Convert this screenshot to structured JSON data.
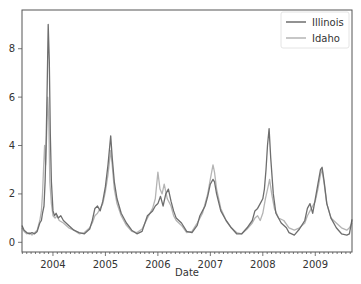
{
  "chart_data": {
    "type": "line",
    "title": "",
    "xlabel": "Date",
    "ylabel": "",
    "xlim": [
      2003.41,
      2009.7
    ],
    "ylim": [
      -0.4,
      9.6
    ],
    "grid": false,
    "legend_position": "upper right",
    "x_ticks": [
      2004,
      2005,
      2006,
      2007,
      2008,
      2009
    ],
    "x_tick_labels": [
      "2004",
      "2005",
      "2006",
      "2007",
      "2008",
      "2009"
    ],
    "y_ticks": [
      0,
      2,
      4,
      6,
      8
    ],
    "y_tick_labels": [
      "0",
      "2",
      "4",
      "6",
      "8"
    ],
    "series": [
      {
        "name": "Illinois",
        "color": "#6e6e6e",
        "points": [
          [
            2003.41,
            0.7
          ],
          [
            2003.45,
            0.5
          ],
          [
            2003.5,
            0.4
          ],
          [
            2003.55,
            0.35
          ],
          [
            2003.6,
            0.4
          ],
          [
            2003.65,
            0.35
          ],
          [
            2003.7,
            0.45
          ],
          [
            2003.75,
            0.8
          ],
          [
            2003.78,
            0.9
          ],
          [
            2003.8,
            1.2
          ],
          [
            2003.83,
            1.5
          ],
          [
            2003.85,
            2.5
          ],
          [
            2003.87,
            4.0
          ],
          [
            2003.89,
            6.5
          ],
          [
            2003.91,
            9.0
          ],
          [
            2003.93,
            7.5
          ],
          [
            2003.95,
            4.5
          ],
          [
            2003.97,
            2.5
          ],
          [
            2004.0,
            1.3
          ],
          [
            2004.03,
            1.1
          ],
          [
            2004.06,
            1.2
          ],
          [
            2004.1,
            1.0
          ],
          [
            2004.15,
            1.1
          ],
          [
            2004.2,
            0.9
          ],
          [
            2004.3,
            0.7
          ],
          [
            2004.4,
            0.5
          ],
          [
            2004.5,
            0.4
          ],
          [
            2004.6,
            0.35
          ],
          [
            2004.7,
            0.55
          ],
          [
            2004.75,
            0.9
          ],
          [
            2004.8,
            1.4
          ],
          [
            2004.85,
            1.5
          ],
          [
            2004.9,
            1.3
          ],
          [
            2004.95,
            1.7
          ],
          [
            2005.0,
            2.3
          ],
          [
            2005.05,
            3.2
          ],
          [
            2005.1,
            4.4
          ],
          [
            2005.13,
            3.5
          ],
          [
            2005.17,
            2.5
          ],
          [
            2005.22,
            1.8
          ],
          [
            2005.3,
            1.2
          ],
          [
            2005.4,
            0.8
          ],
          [
            2005.5,
            0.5
          ],
          [
            2005.6,
            0.35
          ],
          [
            2005.7,
            0.45
          ],
          [
            2005.8,
            1.1
          ],
          [
            2005.9,
            1.3
          ],
          [
            2005.95,
            1.5
          ],
          [
            2006.0,
            1.6
          ],
          [
            2006.05,
            1.9
          ],
          [
            2006.1,
            1.5
          ],
          [
            2006.15,
            2.0
          ],
          [
            2006.2,
            2.2
          ],
          [
            2006.25,
            1.7
          ],
          [
            2006.3,
            1.3
          ],
          [
            2006.35,
            1.0
          ],
          [
            2006.45,
            0.8
          ],
          [
            2006.55,
            0.45
          ],
          [
            2006.65,
            0.4
          ],
          [
            2006.75,
            0.7
          ],
          [
            2006.8,
            1.1
          ],
          [
            2006.85,
            1.3
          ],
          [
            2006.9,
            1.5
          ],
          [
            2006.95,
            1.9
          ],
          [
            2007.0,
            2.4
          ],
          [
            2007.05,
            2.6
          ],
          [
            2007.08,
            2.5
          ],
          [
            2007.12,
            2.0
          ],
          [
            2007.2,
            1.3
          ],
          [
            2007.3,
            0.9
          ],
          [
            2007.4,
            0.6
          ],
          [
            2007.5,
            0.35
          ],
          [
            2007.6,
            0.35
          ],
          [
            2007.7,
            0.6
          ],
          [
            2007.8,
            0.9
          ],
          [
            2007.85,
            1.3
          ],
          [
            2007.9,
            1.4
          ],
          [
            2007.95,
            1.6
          ],
          [
            2008.0,
            1.8
          ],
          [
            2008.03,
            2.2
          ],
          [
            2008.06,
            3.0
          ],
          [
            2008.09,
            4.0
          ],
          [
            2008.12,
            4.7
          ],
          [
            2008.15,
            3.5
          ],
          [
            2008.2,
            2.0
          ],
          [
            2008.25,
            1.2
          ],
          [
            2008.35,
            0.8
          ],
          [
            2008.45,
            0.6
          ],
          [
            2008.5,
            0.4
          ],
          [
            2008.6,
            0.3
          ],
          [
            2008.7,
            0.55
          ],
          [
            2008.8,
            0.9
          ],
          [
            2008.85,
            1.4
          ],
          [
            2008.9,
            1.6
          ],
          [
            2008.95,
            1.2
          ],
          [
            2009.0,
            1.8
          ],
          [
            2009.05,
            2.4
          ],
          [
            2009.1,
            3.0
          ],
          [
            2009.13,
            3.1
          ],
          [
            2009.17,
            2.5
          ],
          [
            2009.22,
            1.6
          ],
          [
            2009.3,
            1.0
          ],
          [
            2009.4,
            0.6
          ],
          [
            2009.5,
            0.35
          ],
          [
            2009.6,
            0.3
          ],
          [
            2009.65,
            0.35
          ],
          [
            2009.7,
            0.95
          ]
        ]
      },
      {
        "name": "Idaho",
        "color": "#b4b4b4",
        "points": [
          [
            2003.41,
            0.6
          ],
          [
            2003.45,
            0.45
          ],
          [
            2003.5,
            0.35
          ],
          [
            2003.55,
            0.4
          ],
          [
            2003.6,
            0.3
          ],
          [
            2003.65,
            0.4
          ],
          [
            2003.7,
            0.5
          ],
          [
            2003.75,
            0.9
          ],
          [
            2003.78,
            1.3
          ],
          [
            2003.8,
            2.0
          ],
          [
            2003.82,
            3.0
          ],
          [
            2003.84,
            4.0
          ],
          [
            2003.86,
            3.2
          ],
          [
            2003.88,
            4.5
          ],
          [
            2003.9,
            6.0
          ],
          [
            2003.92,
            5.0
          ],
          [
            2003.94,
            2.5
          ],
          [
            2003.97,
            1.6
          ],
          [
            2004.0,
            1.1
          ],
          [
            2004.04,
            1.0
          ],
          [
            2004.08,
            1.1
          ],
          [
            2004.12,
            0.9
          ],
          [
            2004.2,
            0.8
          ],
          [
            2004.3,
            0.6
          ],
          [
            2004.4,
            0.5
          ],
          [
            2004.5,
            0.35
          ],
          [
            2004.6,
            0.4
          ],
          [
            2004.7,
            0.6
          ],
          [
            2004.75,
            0.8
          ],
          [
            2004.8,
            1.1
          ],
          [
            2004.85,
            1.2
          ],
          [
            2004.9,
            1.4
          ],
          [
            2004.95,
            1.6
          ],
          [
            2005.0,
            2.1
          ],
          [
            2005.05,
            2.8
          ],
          [
            2005.1,
            3.8
          ],
          [
            2005.13,
            3.2
          ],
          [
            2005.17,
            2.2
          ],
          [
            2005.22,
            1.6
          ],
          [
            2005.3,
            1.1
          ],
          [
            2005.4,
            0.7
          ],
          [
            2005.5,
            0.45
          ],
          [
            2005.6,
            0.4
          ],
          [
            2005.7,
            0.55
          ],
          [
            2005.8,
            1.0
          ],
          [
            2005.9,
            1.4
          ],
          [
            2005.95,
            1.8
          ],
          [
            2006.0,
            2.9
          ],
          [
            2006.04,
            2.2
          ],
          [
            2006.08,
            2.0
          ],
          [
            2006.12,
            2.4
          ],
          [
            2006.18,
            1.8
          ],
          [
            2006.25,
            1.5
          ],
          [
            2006.3,
            1.1
          ],
          [
            2006.35,
            0.9
          ],
          [
            2006.45,
            0.7
          ],
          [
            2006.55,
            0.4
          ],
          [
            2006.65,
            0.45
          ],
          [
            2006.75,
            0.8
          ],
          [
            2006.8,
            1.0
          ],
          [
            2006.85,
            1.2
          ],
          [
            2006.9,
            1.6
          ],
          [
            2006.95,
            2.0
          ],
          [
            2007.0,
            2.6
          ],
          [
            2007.05,
            3.2
          ],
          [
            2007.08,
            2.9
          ],
          [
            2007.12,
            2.2
          ],
          [
            2007.2,
            1.4
          ],
          [
            2007.3,
            0.9
          ],
          [
            2007.4,
            0.6
          ],
          [
            2007.5,
            0.4
          ],
          [
            2007.6,
            0.35
          ],
          [
            2007.7,
            0.55
          ],
          [
            2007.8,
            0.8
          ],
          [
            2007.85,
            1.0
          ],
          [
            2007.9,
            1.1
          ],
          [
            2007.95,
            0.9
          ],
          [
            2008.0,
            1.2
          ],
          [
            2008.05,
            1.8
          ],
          [
            2008.1,
            2.3
          ],
          [
            2008.13,
            2.6
          ],
          [
            2008.17,
            2.0
          ],
          [
            2008.22,
            1.4
          ],
          [
            2008.3,
            1.0
          ],
          [
            2008.4,
            0.9
          ],
          [
            2008.5,
            0.6
          ],
          [
            2008.6,
            0.5
          ],
          [
            2008.7,
            0.6
          ],
          [
            2008.8,
            0.8
          ],
          [
            2008.85,
            1.1
          ],
          [
            2008.9,
            1.3
          ],
          [
            2008.95,
            1.5
          ],
          [
            2009.0,
            1.7
          ],
          [
            2009.05,
            2.2
          ],
          [
            2009.1,
            2.8
          ],
          [
            2009.13,
            3.0
          ],
          [
            2009.17,
            2.4
          ],
          [
            2009.22,
            1.6
          ],
          [
            2009.3,
            1.0
          ],
          [
            2009.4,
            0.8
          ],
          [
            2009.5,
            0.6
          ],
          [
            2009.6,
            0.5
          ],
          [
            2009.65,
            0.6
          ],
          [
            2009.7,
            0.8
          ]
        ]
      }
    ]
  },
  "legend": {
    "items": [
      {
        "label": "Illinois",
        "color": "#6e6e6e"
      },
      {
        "label": "Idaho",
        "color": "#b4b4b4"
      }
    ]
  },
  "axes": {
    "xlabel": "Date",
    "x_ticks": [
      "2004",
      "2005",
      "2006",
      "2007",
      "2008",
      "2009"
    ],
    "y_ticks": [
      "0",
      "2",
      "4",
      "6",
      "8"
    ]
  }
}
